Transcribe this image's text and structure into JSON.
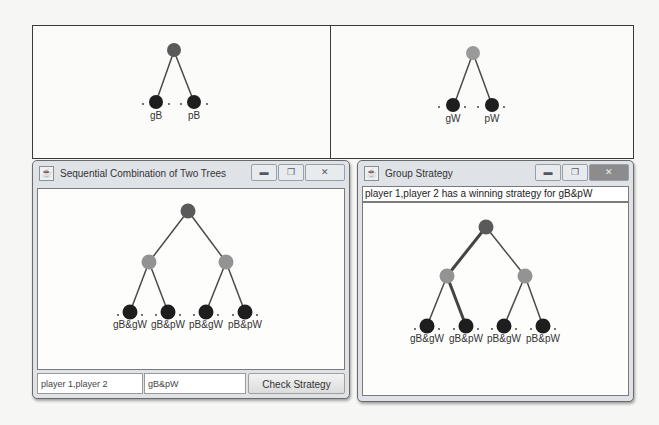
{
  "colors": {
    "root_node": "#5a5a5a",
    "mid_node": "#8d8d8d",
    "leaf_node": "#1e1e1e",
    "edge": "#4a4a4a",
    "highlight_edge": "#444444"
  },
  "tree_left": {
    "leaves": [
      {
        "label": "gB"
      },
      {
        "label": "pB"
      }
    ]
  },
  "tree_right": {
    "leaves": [
      {
        "label": "gW"
      },
      {
        "label": "pW"
      }
    ]
  },
  "window_sequential": {
    "title": "Sequential Combination of Two Trees",
    "icon": "java-cup-icon",
    "controls": {
      "minimize": "minimize-icon",
      "maximize": "maximize-icon",
      "close": "close-icon"
    },
    "tree": {
      "leaves": [
        {
          "label": "gB&gW"
        },
        {
          "label": "gB&pW"
        },
        {
          "label": "pB&gW"
        },
        {
          "label": "pB&pW"
        }
      ]
    },
    "players_field_value": "player 1,player 2",
    "strategy_field_value": "gB&pW",
    "check_button_label": "Check Strategy"
  },
  "window_group": {
    "title": "Group Strategy",
    "icon": "java-cup-icon",
    "controls": {
      "minimize": "minimize-icon",
      "maximize": "maximize-icon",
      "close": "close-icon"
    },
    "status_text": "player 1,player 2 has a winning strategy for gB&pW",
    "tree": {
      "leaves": [
        {
          "label": "gB&gW"
        },
        {
          "label": "gB&pW"
        },
        {
          "label": "pB&gW"
        },
        {
          "label": "pB&pW"
        }
      ],
      "highlighted_path": [
        "root",
        "left",
        "gB&pW"
      ]
    }
  }
}
